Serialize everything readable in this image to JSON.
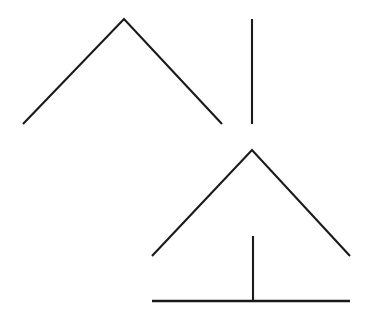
{
  "canvas": {
    "width": 365,
    "height": 324,
    "background_color": "#ffffff",
    "stroke_color": "#1a1a1a",
    "stroke_width": 2
  },
  "chart_data": {
    "type": "line",
    "title": "",
    "subtitle": "",
    "xlabel": "",
    "ylabel": "",
    "xlim": [
      0,
      365
    ],
    "ylim": [
      0,
      324
    ],
    "grid": false,
    "legend": "none",
    "axis_visible": false,
    "tick_labels": [],
    "annotations": [],
    "series": [
      {
        "name": "upper-chevron",
        "kind": "polyline",
        "closed": false,
        "points": [
          [
            23,
            124
          ],
          [
            124,
            19
          ],
          [
            222,
            124
          ]
        ],
        "stroke_width": 2.1
      },
      {
        "name": "upper-vertical-bar",
        "kind": "polyline",
        "closed": false,
        "points": [
          [
            252,
            19
          ],
          [
            252,
            124
          ]
        ],
        "stroke_width": 2.1
      },
      {
        "name": "lower-chevron",
        "kind": "polyline",
        "closed": false,
        "points": [
          [
            152,
            256
          ],
          [
            252,
            150
          ],
          [
            350,
            256
          ]
        ],
        "stroke_width": 2.1
      },
      {
        "name": "lower-vertical-stem",
        "kind": "polyline",
        "closed": false,
        "points": [
          [
            253,
            236
          ],
          [
            253,
            301
          ]
        ],
        "stroke_width": 2.1
      },
      {
        "name": "lower-baseline",
        "kind": "polyline",
        "closed": false,
        "points": [
          [
            152,
            301
          ],
          [
            350,
            301
          ]
        ],
        "stroke_width": 2.6
      }
    ]
  },
  "figures": [
    {
      "id": "upper-figure",
      "label": "upper figure",
      "parts": [
        "chevron",
        "vertical bar"
      ]
    },
    {
      "id": "lower-figure",
      "label": "lower figure",
      "parts": [
        "chevron",
        "vertical stem",
        "baseline"
      ]
    }
  ]
}
